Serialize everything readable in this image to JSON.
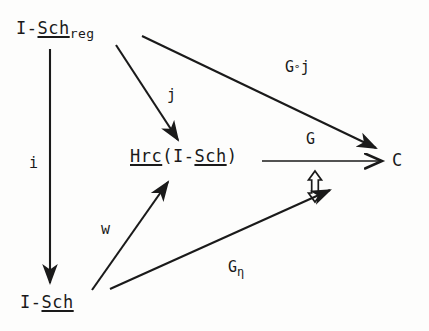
{
  "diagram": {
    "background_color": "#fdfdfc",
    "ink_color": "#1a1a1a",
    "nodes": [
      {
        "id": "isch-reg",
        "name": "node-isch-reg",
        "text": "I-Sch_reg",
        "prefix": "I-",
        "underlined": "Sch",
        "subscript": "reg"
      },
      {
        "id": "hrc",
        "name": "node-hrc",
        "text": "Hrc(I-Sch)",
        "underlined_head": "Hrc",
        "open_paren": "(I-",
        "underlined_tail": "Sch",
        "close_paren": ")"
      },
      {
        "id": "isch",
        "name": "node-isch",
        "text": "I-Sch",
        "prefix": "I-",
        "underlined": "Sch"
      },
      {
        "id": "c",
        "name": "node-c",
        "text": "C"
      }
    ],
    "edges": [
      {
        "id": "i",
        "label": "i",
        "from": "isch-reg",
        "to": "isch",
        "style": "solid-filled-head"
      },
      {
        "id": "j",
        "label": "j",
        "from": "isch-reg",
        "to": "hrc",
        "style": "solid-filled-head"
      },
      {
        "id": "goj",
        "label": "G",
        "label_composition": "∘",
        "label_tail": "j",
        "from": "isch-reg",
        "to": "c",
        "style": "solid-filled-head"
      },
      {
        "id": "w",
        "label": "w",
        "from": "isch",
        "to": "hrc",
        "style": "solid-filled-head"
      },
      {
        "id": "g",
        "label": "G",
        "from": "hrc",
        "to": "c",
        "style": "solid-open-head"
      },
      {
        "id": "geta",
        "label": "G",
        "label_sub": "η",
        "from": "isch",
        "to": "c",
        "style": "solid-filled-head"
      }
    ],
    "transformation": {
      "id": "nat-trans",
      "glyph": "⇕",
      "description": "hollow double-headed vertical arrow"
    }
  }
}
